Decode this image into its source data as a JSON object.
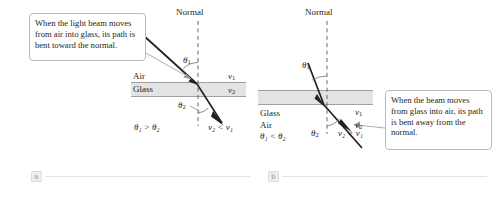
{
  "figure": {
    "background_color": "#ffffff",
    "ray_color": "#231f20",
    "glass_fill": "#e3e3e3",
    "callout_border": "#b9b9b9"
  },
  "panel_a": {
    "badge": "a",
    "callout": "When the light beam moves from air into glass, its path is bent toward the normal.",
    "normal_label": "Normal",
    "upper_medium": "Air",
    "lower_medium": "Glass",
    "angle_incidence": "θ",
    "angle_incidence_sub": "1",
    "angle_refraction": "θ",
    "angle_refraction_sub": "2",
    "speed_upper": "v",
    "speed_upper_sub": "1",
    "speed_lower": "v",
    "speed_lower_sub": "2",
    "angle_relation": "θ₁ > θ₂",
    "speed_relation": "v₂ < v₁"
  },
  "panel_b": {
    "badge": "b",
    "callout": "When the beam moves from glass into air, its path is bent away from the normal.",
    "normal_label": "Normal",
    "upper_medium": "Glass",
    "lower_medium": "Air",
    "angle_incidence": "θ",
    "angle_incidence_sub": "1",
    "angle_refraction": "θ",
    "angle_refraction_sub": "2",
    "speed_upper": "v",
    "speed_upper_sub": "1",
    "speed_lower": "v",
    "speed_lower_sub": "2",
    "angle_relation": "θ₁ < θ₂",
    "speed_relation": "v₂ > v₁"
  }
}
